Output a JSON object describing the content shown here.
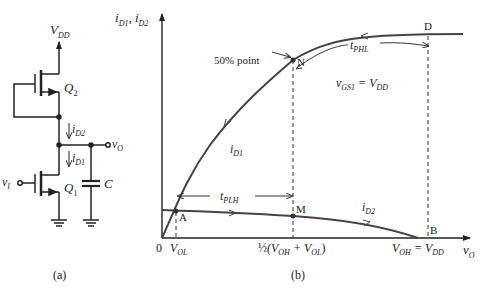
{
  "panel_a": {
    "caption": "(a)",
    "supply": {
      "main": "V",
      "sub": "DD"
    },
    "transistor_top": {
      "main": "Q",
      "sub": "2"
    },
    "transistor_bottom": {
      "main": "Q",
      "sub": "1"
    },
    "current_top": {
      "main": "i",
      "sub": "D2"
    },
    "current_bottom": {
      "main": "i",
      "sub": "D1"
    },
    "output": {
      "main": "v",
      "sub": "O"
    },
    "input": {
      "main": "v",
      "sub": "I"
    },
    "capacitor": "C"
  },
  "panel_b": {
    "caption": "(b)",
    "y_axis": {
      "main": "i",
      "sub1": "D1",
      "sep": ", ",
      "main2": "i",
      "sub2": "D2"
    },
    "x_axis": {
      "main": "v",
      "sub": "O"
    },
    "origin": "0",
    "x_ticks": {
      "vol": {
        "main": "V",
        "sub": "OL"
      },
      "mid": {
        "frac": "½",
        "open": "(V",
        "sub1": "OH",
        "plus": " + V",
        "sub2": "OL",
        "close": ")"
      },
      "voh": {
        "main": "V",
        "sub": "OH",
        "eq": " = V",
        "sub2": "DD"
      }
    },
    "points": {
      "A": "A",
      "M": "M",
      "N": "N",
      "D": "D",
      "B": "B"
    },
    "annotation_50": "50% point",
    "tphl": {
      "main": "t",
      "sub": "PHL"
    },
    "tplh": {
      "main": "t",
      "sub": "PLH"
    },
    "curve_label_id1": {
      "main": "i",
      "sub": "D1"
    },
    "curve_label_id2": {
      "main": "i",
      "sub": "D2"
    },
    "vgs_label": {
      "main": "v",
      "sub": "GS1",
      "eq": " = V",
      "sub2": "DD"
    },
    "line_color": "#444444"
  }
}
